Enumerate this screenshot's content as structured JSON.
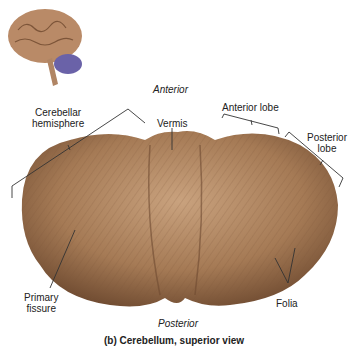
{
  "figure": {
    "caption": "(b) Cerebellum, superior view",
    "orientation": {
      "top": "Anterior",
      "bottom": "Posterior"
    },
    "labels": {
      "cerebellar_hemisphere": [
        "Cerebellar",
        "hemisphere"
      ],
      "vermis": "Vermis",
      "anterior_lobe": "Anterior lobe",
      "posterior_lobe": [
        "Posterior",
        "lobe"
      ],
      "primary_fissure": [
        "Primary",
        "fissure"
      ],
      "folia": "Folia"
    },
    "colors": {
      "tissue": "#a57a55",
      "tissue_dark": "#6e4a30",
      "cerebellum_inset": "#6a62a8",
      "brain_inset": "#b98a67"
    }
  }
}
